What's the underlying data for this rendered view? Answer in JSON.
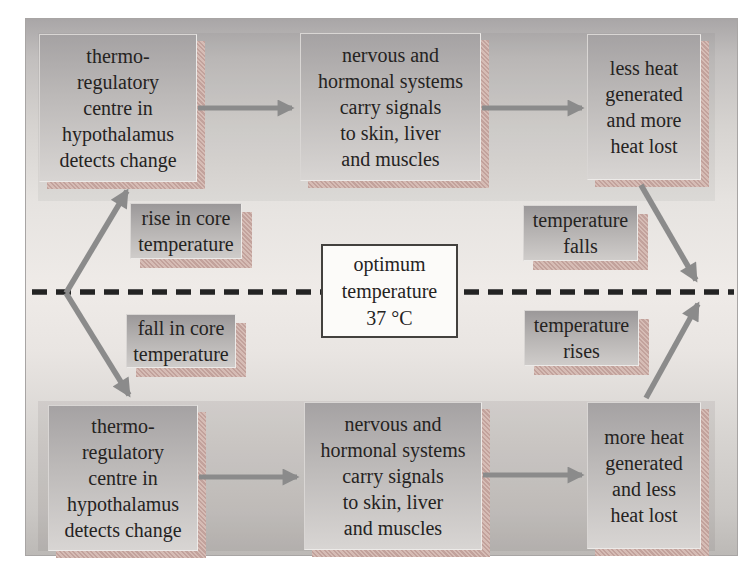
{
  "diagram_subject": "thermoregulation negative feedback",
  "colors": {
    "arrow": "#8b8b8b",
    "dashed_line": "#232323",
    "shadow_hatch_pink": "#c2a29c",
    "box_gradient_top": "#a5a2a3",
    "box_gradient_bottom": "#d8d5d3",
    "text": "#25231f",
    "center_box_bg": "#fcfbf9"
  },
  "boxes": {
    "top_left": {
      "lines": [
        "thermo-",
        "regulatory",
        "centre in",
        "hypothalamus",
        "detects change"
      ]
    },
    "top_middle": {
      "lines": [
        "nervous and",
        "hormonal systems",
        "carry signals",
        "to skin, liver",
        "and muscles"
      ]
    },
    "top_right": {
      "lines": [
        "less heat",
        "generated",
        "and more",
        "heat lost"
      ]
    },
    "bottom_left": {
      "lines": [
        "thermo-",
        "regulatory",
        "centre in",
        "hypothalamus",
        "detects change"
      ]
    },
    "bottom_middle": {
      "lines": [
        "nervous and",
        "hormonal systems",
        "carry signals",
        "to skin, liver",
        "and muscles"
      ]
    },
    "bottom_right": {
      "lines": [
        "more heat",
        "generated",
        "and less",
        "heat lost"
      ]
    }
  },
  "labels": {
    "rise": {
      "lines": [
        "rise in core",
        "temperature"
      ]
    },
    "temp_falls": {
      "lines": [
        "temperature",
        "falls"
      ]
    },
    "fall": {
      "lines": [
        "fall in core",
        "temperature"
      ]
    },
    "temp_rises": {
      "lines": [
        "temperature",
        "rises"
      ]
    }
  },
  "center_box": {
    "lines": [
      "optimum",
      "temperature",
      "37 °C"
    ]
  }
}
